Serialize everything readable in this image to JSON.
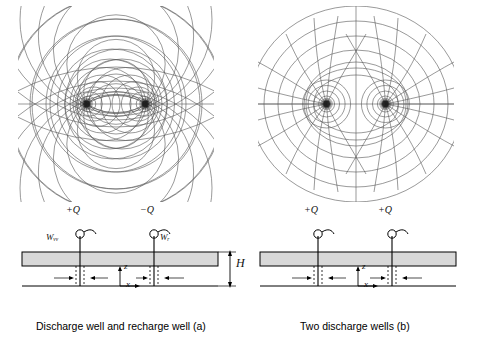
{
  "figure": {
    "panels": [
      {
        "id": "a",
        "caption": "Discharge well and recharge well (a)",
        "flownet": {
          "type": "two-well-flow-net",
          "wells": [
            {
              "label": "+Q",
              "sign": "positive",
              "x_frac": 0.34,
              "y_frac": 0.5
            },
            {
              "label": "-Q",
              "sign": "negative",
              "x_frac": 0.66,
              "y_frac": 0.5
            }
          ],
          "equipotentials": "circles of Apollonius",
          "streamlines": "coaxial circular arcs through both wells"
        },
        "section": {
          "well_labels": [
            "+Q",
            "−Q"
          ],
          "well_name_labels": [
            "Wᵥᵥ",
            "Wᵣ"
          ],
          "axis_labels": {
            "vertical": "z",
            "horizontal": "x"
          },
          "thickness_label": "H"
        }
      },
      {
        "id": "b",
        "caption": "Two discharge wells (b)",
        "flownet": {
          "type": "two-well-flow-net",
          "wells": [
            {
              "label": "+Q",
              "sign": "positive",
              "x_frac": 0.34,
              "y_frac": 0.5
            },
            {
              "label": "+Q",
              "sign": "positive",
              "x_frac": 0.66,
              "y_frac": 0.5
            }
          ],
          "equipotentials": "Cassini-type closed curves about both wells",
          "streamlines": "orthogonal family with a straight divide between wells"
        },
        "section": {
          "well_labels": [
            "+Q",
            "+Q"
          ],
          "well_name_labels": [],
          "axis_labels": {
            "vertical": "z",
            "horizontal": "x"
          },
          "thickness_label": ""
        }
      }
    ],
    "colors": {
      "line": "#555555",
      "ink": "#000000",
      "aquifer_fill": "#d8d8d8",
      "background": "#ffffff"
    }
  }
}
